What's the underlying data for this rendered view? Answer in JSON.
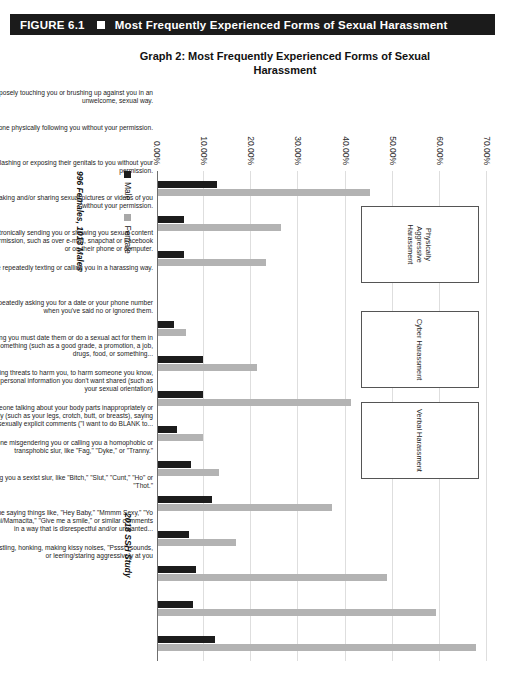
{
  "figure": {
    "number": "FIGURE 6.1",
    "title": "Most Frequently Experienced Forms of Sexual Harassment",
    "marker": "square-bullet"
  },
  "source_note": "2018 SSH Study",
  "sample_note": "996 Females, 1013 Males",
  "legend": {
    "male_label": "Male",
    "female_label": "Female",
    "male_color": "#1c1c1c",
    "female_color": "#b3b3b3"
  },
  "group_boxes": [
    {
      "label": "Physically Aggressive Harassment"
    },
    {
      "label": "Cyber Harassment"
    },
    {
      "label": "Verbal Harassment"
    }
  ],
  "chart_data": {
    "type": "bar",
    "title": "Graph 2: Most Frequently Experienced Forms of Sexual Harassment",
    "xlabel": "",
    "ylabel": "",
    "ylim": [
      0,
      70
    ],
    "ytick_labels": [
      "0.00%",
      "10.00%",
      "20.00%",
      "30.00%",
      "40.00%",
      "50.00%",
      "60.00%",
      "70.00%"
    ],
    "ytick_values": [
      0,
      10,
      20,
      30,
      40,
      50,
      60,
      70
    ],
    "grid": true,
    "legend_position": "bottom-left",
    "orientation": "vertical-rotated",
    "categories": [
      "Someone purposely touching you or brushing up against you in an unwelcome, sexual way.",
      "Someone physically following you without your permission.",
      "Someone flashing or exposing their genitals to you without your permission.",
      "Someone taking and/or sharing sexual pictures or videos of you without your permission.",
      "Someone electronically sending you or showing you sexual content without your permission, such as over e-mail, snapchat or Facebook or on their phone or computer.",
      "Someone repeatedly texting or calling you in a harassing way.",
      "Someone repeatedly asking you for a date or your phone number when you've said no or ignored them.",
      "Someone saying you must date them or do a sexual act for them in exchange for something (such as a good grade, a promotion, a job, drugs, food, or something...",
      "Someone making threats to harm you, to harm someone you know, or to share personal information you don't want shared (such as your sexual orientation)",
      "Someone talking about your body parts inappropriately or offensively (such as your legs, crotch, butt, or breasts), saying sexually explicit comments (\"I want to do BLANK to...",
      "Someone misgendering you or calling you a homophobic or transphobic slur, like \"Fag,\" \"Dyke,\" or \"Tranny.\"",
      "Someone calling you a sexist slur, like \"Bitch,\" \"Slut,\" \"Cunt,\" \"Ho\" or \"Thot.\"",
      "Someone saying things like, \"Hey Baby,\" \"Mmmm Sexy,\" \"Yo Shorty,\" \"Mami/Mamacita,\" \"Give me a smile,\" or similar comments in a way that is disrespectful and/or unwanted...",
      "Someone whistling, honking, making kissy noises, \"Pssst\" sounds, or leering/staring aggressively at you"
    ],
    "series": [
      {
        "name": "Male",
        "color": "#1c1c1c",
        "values": [
          12.5,
          5.5,
          5.5,
          0,
          3.5,
          9.5,
          9.5,
          4.0,
          7.0,
          11.5,
          6.5,
          8.0,
          7.5,
          12.0
        ]
      },
      {
        "name": "Female",
        "color": "#b3b3b3",
        "values": [
          45.0,
          26.0,
          23.0,
          0,
          6.0,
          21.0,
          41.0,
          9.5,
          13.0,
          37.0,
          16.5,
          48.5,
          59.0,
          67.5
        ]
      }
    ]
  }
}
